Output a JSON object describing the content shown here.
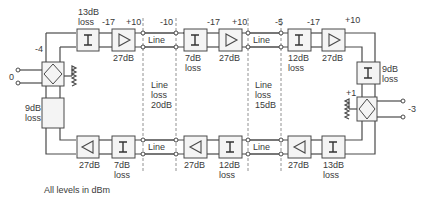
{
  "diagram": {
    "caption": "All levels in dBm",
    "colors": {
      "line": "#4a4a4a",
      "box_fill": "#f2f2f2",
      "dashed": "#777777"
    },
    "left_hybrid": {
      "input_level": "0",
      "top_level": "-4",
      "pad": {
        "label1": "9dB",
        "label2": "loss"
      }
    },
    "right_hybrid": {
      "output_level": "-3",
      "top_level": "+1",
      "pad": {
        "label1": "9dB",
        "label2": "loss"
      }
    },
    "top_path": {
      "stage1": {
        "isolator_label1": "13dB",
        "isolator_label2": "loss",
        "in_level": "-17",
        "out_level": "+10",
        "amp_gain": "27dB"
      },
      "line1": {
        "label": "Line",
        "level": "-10"
      },
      "stage2": {
        "isolator_label1": "7dB",
        "isolator_label2": "loss",
        "in_level": "-17",
        "out_level": "+10",
        "amp_gain": "27dB"
      },
      "line2": {
        "label": "Line",
        "level": "-5"
      },
      "stage3": {
        "isolator_label1": "12dB",
        "isolator_label2": "loss",
        "in_level": "-17",
        "out_level": "+10",
        "amp_gain": "27dB"
      }
    },
    "bottom_path": {
      "stage1": {
        "amp_gain": "27dB",
        "isolator_label1": "7dB",
        "isolator_label2": "loss"
      },
      "line1": {
        "label": "Line"
      },
      "stage2": {
        "amp_gain": "27dB",
        "isolator_label1": "12dB",
        "isolator_label2": "loss"
      },
      "line2": {
        "label": "Line"
      },
      "stage3": {
        "amp_gain": "27dB",
        "isolator_label1": "13dB",
        "isolator_label2": "loss"
      }
    },
    "line_sections": [
      {
        "label1": "Line",
        "label2": "loss",
        "label3": "20dB"
      },
      {
        "label1": "Line",
        "label2": "loss",
        "label3": "15dB"
      }
    ],
    "isolator_symbol": "I"
  }
}
